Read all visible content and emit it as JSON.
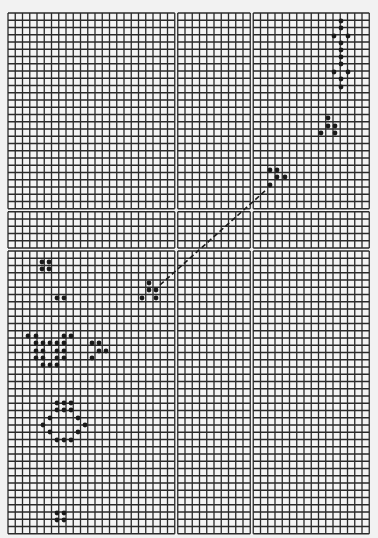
{
  "figure": {
    "type": "grid-pattern-diagram",
    "background": "#f2f2f2",
    "grid_line_color": "#2a2a2a",
    "dot_color": "#1a1a1a",
    "grid": {
      "x0": 8,
      "y0": 13,
      "cell": 7.25,
      "col_blocks": [
        23,
        10,
        16
      ],
      "row_blocks": [
        27,
        5,
        39
      ],
      "gap": 3
    },
    "diagonal_line": {
      "x1": 160,
      "y1": 285,
      "x2": 266,
      "y2": 190,
      "style": "dashed"
    },
    "patterns": [
      {
        "name": "pentadecathlon-oscillator",
        "dots": [
          [
            341,
            21
          ],
          [
            341,
            28
          ],
          [
            334,
            36
          ],
          [
            348,
            36
          ],
          [
            341,
            43
          ],
          [
            341,
            50
          ],
          [
            341,
            57
          ],
          [
            341,
            64
          ],
          [
            334,
            72
          ],
          [
            348,
            72
          ],
          [
            341,
            79
          ],
          [
            341,
            87
          ]
        ]
      },
      {
        "name": "glider-top-right",
        "dots": [
          [
            328,
            118
          ],
          [
            328,
            126
          ],
          [
            335,
            126
          ],
          [
            321,
            133
          ],
          [
            335,
            133
          ]
        ]
      },
      {
        "name": "glider-middle",
        "dots": [
          [
            270,
            170
          ],
          [
            277,
            170
          ],
          [
            277,
            177
          ],
          [
            285,
            177
          ],
          [
            270,
            185
          ]
        ]
      },
      {
        "name": "glider-lower",
        "dots": [
          [
            149,
            283
          ],
          [
            149,
            290
          ],
          [
            156,
            290
          ],
          [
            142,
            298
          ],
          [
            156,
            298
          ]
        ]
      },
      {
        "name": "block-upper-left",
        "dots": [
          [
            42,
            262
          ],
          [
            49,
            262
          ],
          [
            42,
            269
          ],
          [
            49,
            269
          ]
        ]
      },
      {
        "name": "pair-left",
        "dots": [
          [
            57,
            298
          ],
          [
            64,
            298
          ]
        ]
      },
      {
        "name": "cluster-left",
        "dots": [
          [
            28,
            336
          ],
          [
            36,
            336
          ],
          [
            64,
            336
          ],
          [
            71,
            336
          ],
          [
            36,
            343
          ],
          [
            43,
            343
          ],
          [
            50,
            343
          ],
          [
            57,
            343
          ],
          [
            64,
            343
          ],
          [
            36,
            351
          ],
          [
            43,
            351
          ],
          [
            57,
            351
          ],
          [
            64,
            351
          ],
          [
            36,
            358
          ],
          [
            43,
            358
          ],
          [
            57,
            358
          ],
          [
            64,
            358
          ],
          [
            43,
            365
          ],
          [
            50,
            365
          ],
          [
            57,
            365
          ]
        ]
      },
      {
        "name": "small-cluster-right",
        "dots": [
          [
            92,
            343
          ],
          [
            99,
            343
          ],
          [
            99,
            351
          ],
          [
            106,
            351
          ],
          [
            92,
            358
          ]
        ]
      },
      {
        "name": "ring-cluster",
        "dots": [
          [
            57,
            403
          ],
          [
            64,
            403
          ],
          [
            71,
            403
          ],
          [
            57,
            410
          ],
          [
            64,
            410
          ],
          [
            71,
            410
          ],
          [
            50,
            418
          ],
          [
            78,
            418
          ],
          [
            43,
            425
          ],
          [
            85,
            425
          ],
          [
            50,
            432
          ],
          [
            78,
            432
          ],
          [
            57,
            440
          ],
          [
            64,
            440
          ],
          [
            71,
            440
          ]
        ]
      },
      {
        "name": "block-bottom",
        "dots": [
          [
            57,
            513
          ],
          [
            64,
            513
          ],
          [
            57,
            520
          ],
          [
            64,
            520
          ]
        ]
      }
    ]
  }
}
